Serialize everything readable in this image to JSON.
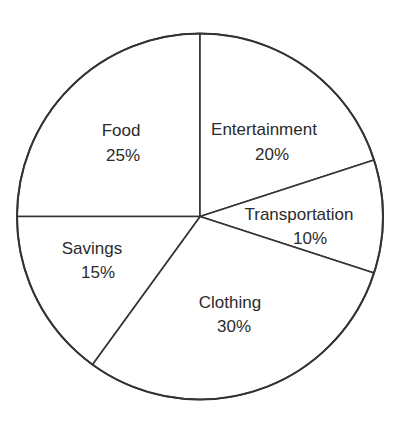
{
  "chart_data": {
    "type": "pie",
    "title": "",
    "categories": [
      "Food",
      "Entertainment",
      "Transportation",
      "Clothing",
      "Savings"
    ],
    "values": [
      25,
      20,
      10,
      30,
      15
    ],
    "unit": "%",
    "labels": [
      {
        "name": "Food",
        "value": "25%"
      },
      {
        "name": "Entertainment",
        "value": "20%"
      },
      {
        "name": "Transportation",
        "value": "10%"
      },
      {
        "name": "Clothing",
        "value": "30%"
      },
      {
        "name": "Savings",
        "value": "15%"
      }
    ],
    "start_angle_deg": -90,
    "direction": "clockwise",
    "legend": "none",
    "slice_fill": "#ffffff",
    "stroke_color": "#333333"
  }
}
